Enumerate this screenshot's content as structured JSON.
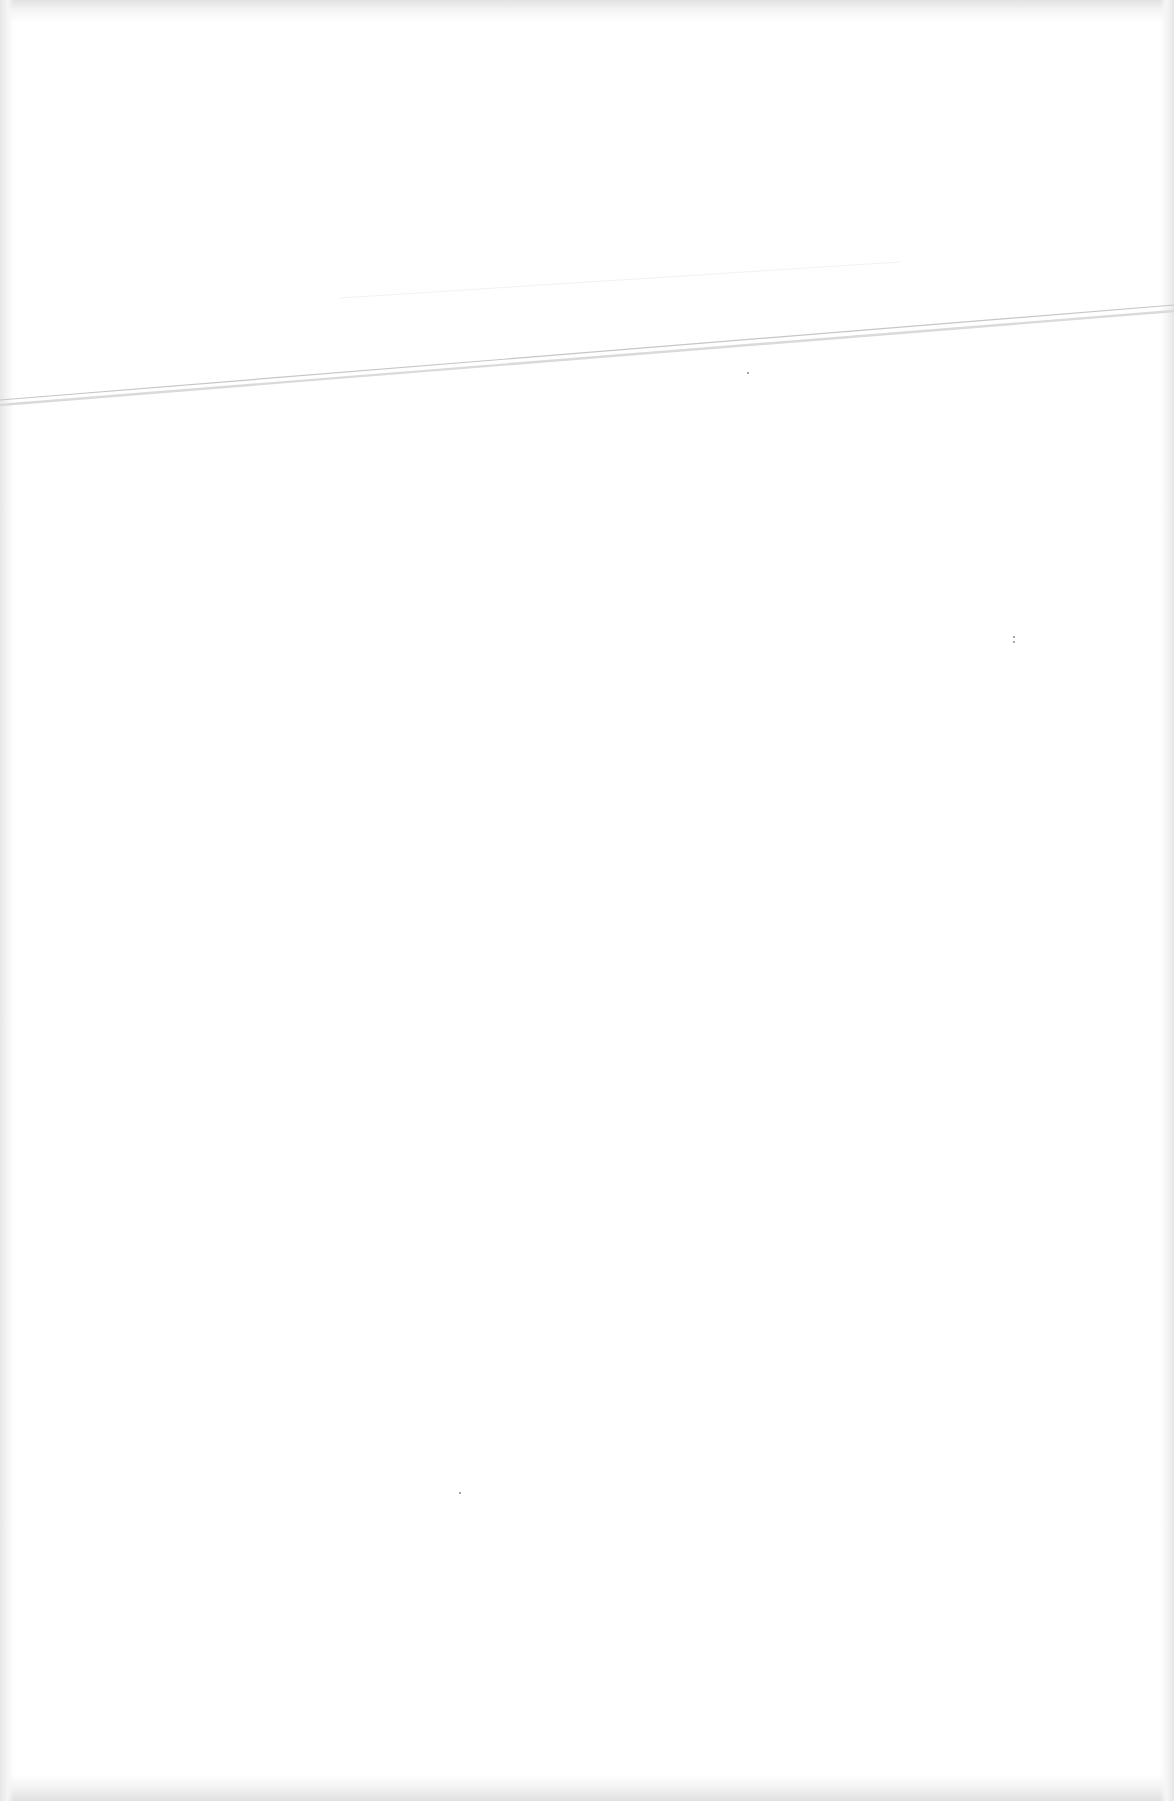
{
  "page": {
    "type": "blank scanned page",
    "background_color": "#ffffff",
    "edge_shade_color": "#e2e2e2",
    "text_content": ""
  },
  "fold_line": {
    "description": "faint diagonal double line across upper page",
    "color_primary": "#c8c8c8",
    "color_secondary": "#dcdcdc",
    "start": [
      0,
      402
    ],
    "end": [
      1174,
      307
    ]
  },
  "specks": [
    {
      "x": 747,
      "y": 372
    },
    {
      "x": 1013,
      "y": 636
    },
    {
      "x": 1013,
      "y": 641
    },
    {
      "x": 459,
      "y": 1492
    }
  ]
}
